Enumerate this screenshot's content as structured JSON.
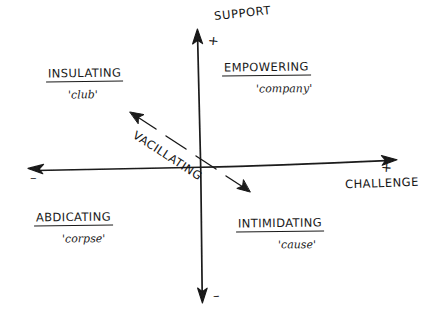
{
  "diagram": {
    "style": "hand-drawn sketch",
    "background_color": "#ffffff",
    "ink_color": "#1a1a1a",
    "axes": {
      "vertical": {
        "name": "support-axis",
        "label": "SUPPORT",
        "positive_sign": "+",
        "negative_sign": "–",
        "positive_end": "top",
        "negative_end": "bottom"
      },
      "horizontal": {
        "name": "challenge-axis",
        "label": "CHALLENGE",
        "positive_sign": "+",
        "negative_sign": "–",
        "positive_end": "right",
        "negative_end": "left"
      },
      "diagonal": {
        "name": "vacillating-arrow",
        "label": "VACILLATING",
        "style": "dashed double-headed arrow",
        "direction": "upper-left to lower-right"
      }
    },
    "quadrants": [
      {
        "id": "insulating",
        "position": "top-left",
        "title": "INSULATING",
        "subtitle": "'club'"
      },
      {
        "id": "empowering",
        "position": "top-right",
        "title": "EMPOWERING",
        "subtitle": "'company'"
      },
      {
        "id": "abdicating",
        "position": "bottom-left",
        "title": "ABDICATING",
        "subtitle": "'corpse'"
      },
      {
        "id": "intimidating",
        "position": "bottom-right",
        "title": "INTIMIDATING",
        "subtitle": "'cause'"
      }
    ]
  }
}
